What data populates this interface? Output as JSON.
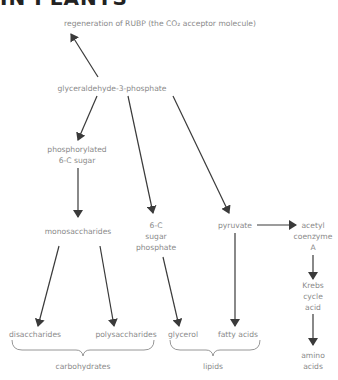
{
  "heading": "IN PLANTS",
  "nodes": {
    "rubp": "regeneration of RUBP (the CO₂ acceptor molecule)",
    "g3p": "glyceraldehyde-3-phosphate",
    "phos6c": "phosphorylated\n6-C sugar",
    "sugar6c": "6-C\nsugar\nphosphate",
    "pyruvate": "pyruvate",
    "acetyl": "acetyl\ncoenzyme\nA",
    "krebs": "Krebs\ncycle\nacid",
    "amino": "amino\nacids",
    "mono": "monosaccharides",
    "di": "disaccharides",
    "poly": "polysaccharides",
    "glycerol": "glycerol",
    "fatty": "fatty acids"
  },
  "groups": {
    "carbohydrates": "carbohydrates",
    "lipids": "lipids"
  },
  "colors": {
    "text": "#8a8a8a",
    "arrow": "#3a3a3a"
  }
}
